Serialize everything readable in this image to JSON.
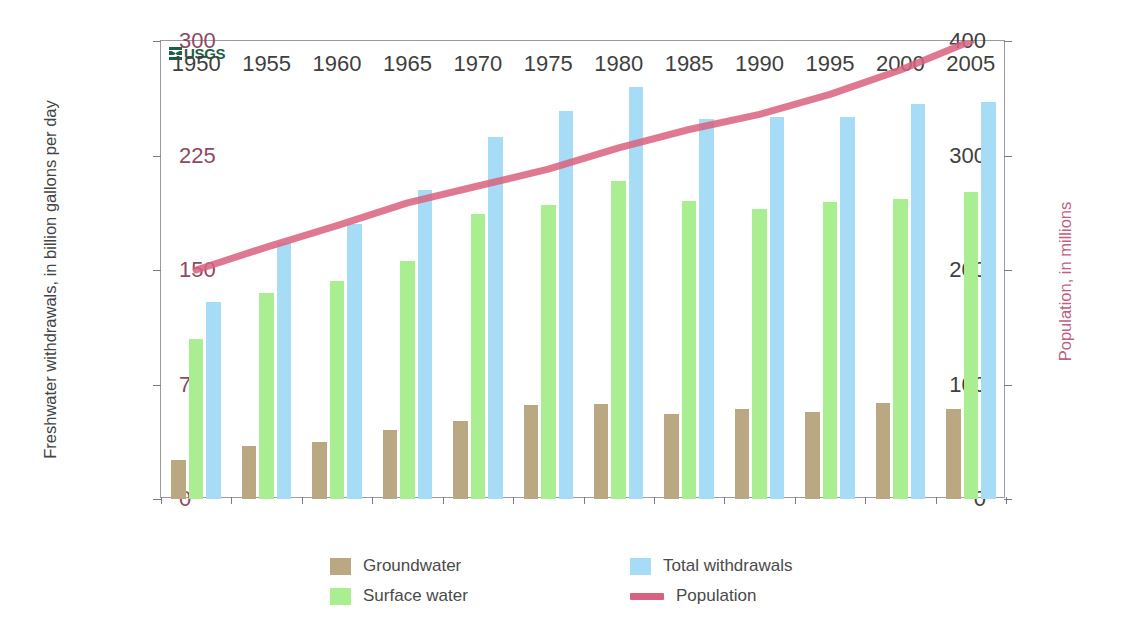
{
  "artifact_text": "",
  "branding": {
    "logo_text": "USGS"
  },
  "axes": {
    "left_title": "Freshwater withdrawals, in billion gallons per day",
    "right_title": "Population, in millions",
    "left_ticks": [
      "0",
      "100",
      "200",
      "300",
      "400"
    ],
    "right_ticks": [
      "0",
      "75",
      "150",
      "225",
      "300"
    ],
    "x_ticks": [
      "1950",
      "1955",
      "1960",
      "1965",
      "1970",
      "1975",
      "1980",
      "1985",
      "1990",
      "1995",
      "2000",
      "2005"
    ]
  },
  "legend": {
    "items": [
      {
        "label": "Groundwater",
        "type": "box",
        "color": "#b9a882"
      },
      {
        "label": "Surface water",
        "type": "box",
        "color": "#a9ef92"
      },
      {
        "label": "Total withdrawals",
        "type": "box",
        "color": "#a6dcf5"
      },
      {
        "label": "Population",
        "type": "line",
        "color": "#d9617f"
      }
    ]
  },
  "colors": {
    "groundwater": "#b9a882",
    "surface_water": "#a9ef92",
    "total_withdrawals": "#a6dcf5",
    "population_line": "#d9617f",
    "usgs_green": "#1c6046",
    "frame": "#9a9aa2"
  },
  "chart_data": {
    "type": "bar",
    "title": "",
    "xlabel": "",
    "ylabel": "Freshwater withdrawals, in billion gallons per day",
    "y2label": "Population, in millions",
    "ylim": [
      0,
      400
    ],
    "y2lim": [
      0,
      300
    ],
    "grid": false,
    "legend_position": "bottom",
    "categories": [
      "1950",
      "1955",
      "1960",
      "1965",
      "1970",
      "1975",
      "1980",
      "1985",
      "1990",
      "1995",
      "2000",
      "2005"
    ],
    "series": [
      {
        "name": "Groundwater",
        "axis": "left",
        "type": "bar",
        "values": [
          34,
          46,
          50,
          60,
          68,
          82,
          83,
          74,
          79,
          76,
          84,
          79
        ]
      },
      {
        "name": "Surface water",
        "axis": "left",
        "type": "bar",
        "values": [
          140,
          180,
          190,
          208,
          249,
          257,
          278,
          260,
          253,
          259,
          262,
          268
        ]
      },
      {
        "name": "Total withdrawals",
        "axis": "left",
        "type": "bar",
        "values": [
          172,
          224,
          240,
          270,
          316,
          339,
          360,
          332,
          334,
          334,
          345,
          347
        ]
      },
      {
        "name": "Population",
        "axis": "right",
        "type": "line",
        "values": [
          150,
          165,
          179,
          194,
          205,
          216,
          230,
          242,
          252,
          265,
          281,
          300
        ]
      }
    ]
  }
}
